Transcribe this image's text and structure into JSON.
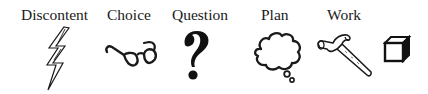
{
  "stages": [
    {
      "label": "Discontent",
      "icon": "lightning-bolt-icon"
    },
    {
      "label": "Choice",
      "icon": "eyeglasses-icon"
    },
    {
      "label": "Question",
      "icon": "question-mark-icon"
    },
    {
      "label": "Plan",
      "icon": "thought-cloud-icon"
    },
    {
      "label": "Work",
      "icon": "hammer-icon"
    },
    {
      "label": "",
      "icon": "cube-icon"
    }
  ],
  "colors": {
    "ink": "#1a1a1a",
    "background": "#ffffff"
  }
}
